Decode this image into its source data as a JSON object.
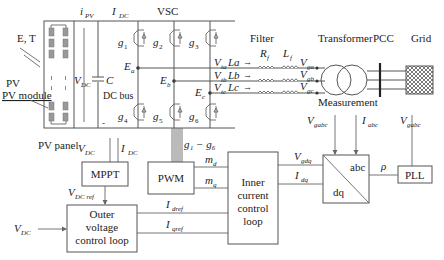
{
  "labels": {
    "et": "E, T",
    "pv_module": "PV module",
    "pv_panel": "PV panel",
    "ipv": "i",
    "ipv_sub": "PV",
    "idc": "I",
    "idc_sub": "DC",
    "vsc": "VSC",
    "vdc": "V",
    "vdc_sub": "DC",
    "cap": "C",
    "dc_bus": "DC bus",
    "minus": "-",
    "filter": "Filter",
    "rf": "R",
    "rf_sub": "f",
    "lf": "L",
    "lf_sub": "f",
    "transformer": "Transformer",
    "pcc": "PCC",
    "grid": "Grid",
    "measurement": "Measurement",
    "g1_g6": "g₁ − g₆",
    "vdcref": "V",
    "vdcref_sub": "DC ref",
    "md": "m",
    "md_sub": "d",
    "mq": "m",
    "mq_sub": "q",
    "idref": "I",
    "idref_sub": "dref",
    "iqref": "I",
    "iqref_sub": "qref",
    "vgdq": "V",
    "vgdq_sub": "gdq",
    "idq": "I",
    "idq_sub": "dq",
    "vgabc": "V",
    "vgabc_sub": "gabc",
    "iabc": "I",
    "iabc_sub": "abc",
    "rho": "ρ",
    "abc": "abc",
    "dq": "dq"
  },
  "switches": [
    {
      "name": "g",
      "sub": "1"
    },
    {
      "name": "g",
      "sub": "2"
    },
    {
      "name": "g",
      "sub": "3"
    },
    {
      "name": "g",
      "sub": "4"
    },
    {
      "name": "g",
      "sub": "5"
    },
    {
      "name": "g",
      "sub": "6"
    }
  ],
  "nodes": {
    "ea": "E",
    "ea_sub": "a",
    "eb": "E",
    "eb_sub": "b",
    "ec": "E",
    "ec_sub": "c"
  },
  "phases": [
    {
      "v": "V",
      "v_sub": "ta",
      "l": "La",
      "vg": "V",
      "vg_sub": "ga"
    },
    {
      "v": "V",
      "v_sub": "tb",
      "l": "Lb",
      "vg": "V",
      "vg_sub": "gb"
    },
    {
      "v": "V",
      "v_sub": "tc",
      "l": "Lc",
      "vg": "V",
      "vg_sub": "gc"
    }
  ],
  "blocks": {
    "mppt": "MPPT",
    "pwm": "PWM",
    "outer": [
      "Outer",
      "voltage",
      "control loop"
    ],
    "inner": [
      "Inner",
      "current",
      "control",
      "loop"
    ],
    "pll": "PLL"
  }
}
